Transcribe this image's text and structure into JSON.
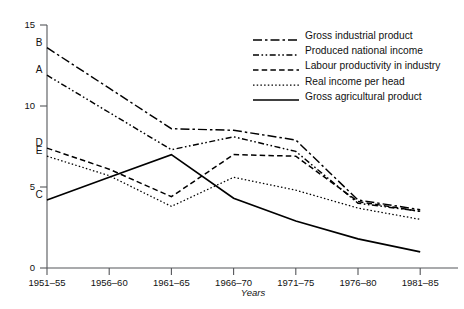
{
  "chart_data": {
    "type": "line",
    "title": "",
    "xlabel": "Years",
    "ylabel": "",
    "categories": [
      "1951–55",
      "1956–60",
      "1961–65",
      "1966–70",
      "1971–75",
      "1976–80",
      "1981–85"
    ],
    "ylim": [
      0,
      15
    ],
    "yticks": [
      0,
      5,
      10,
      15
    ],
    "ytick_labels": [
      "0",
      "5",
      "10",
      "15"
    ],
    "grid": false,
    "legend_position": "top-right",
    "series": [
      {
        "name": "Gross industrial product",
        "key": "gross-industrial-product",
        "point_label": "B",
        "style": "dash-dot",
        "values": [
          13.6,
          11.1,
          8.6,
          8.5,
          7.9,
          4.2,
          3.6
        ]
      },
      {
        "name": "Produced national income",
        "key": "produced-national-income",
        "point_label": "A",
        "style": "dash-dot-dot",
        "values": [
          11.9,
          9.6,
          7.3,
          8.1,
          7.2,
          4.0,
          3.5
        ]
      },
      {
        "name": "Labour productivity in industry",
        "key": "labour-productivity-in-industry",
        "point_label": "D",
        "style": "dashed",
        "values": [
          7.4,
          6.1,
          4.4,
          7.0,
          6.9,
          4.1,
          3.5
        ]
      },
      {
        "name": "Real income per head",
        "key": "real-income-per-head",
        "point_label": "E",
        "style": "dotted",
        "values": [
          6.9,
          5.7,
          3.8,
          5.6,
          4.8,
          3.7,
          3.0
        ]
      },
      {
        "name": "Gross agricultural product",
        "key": "gross-agricultural-product",
        "point_label": "C",
        "style": "solid",
        "values": [
          4.2,
          5.6,
          7.0,
          4.3,
          2.9,
          1.8,
          1.0
        ]
      }
    ]
  },
  "legend": {
    "items": [
      {
        "label": "Gross industrial product",
        "style": "dash-dot"
      },
      {
        "label": "Produced national income",
        "style": "dash-dot-dot"
      },
      {
        "label": "Labour productivity in industry",
        "style": "dashed"
      },
      {
        "label": "Real income per head",
        "style": "dotted"
      },
      {
        "label": "Gross agricultural product",
        "style": "solid"
      }
    ]
  }
}
